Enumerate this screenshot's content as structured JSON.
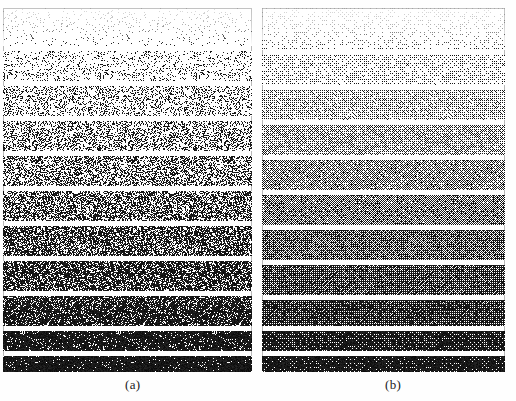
{
  "figure": {
    "type": "halftone-dither-comparison",
    "width": 516,
    "height": 401,
    "background_color": "#ffffff",
    "ink_color": "#000000",
    "border_color": "#b9b9b9",
    "faint_header_text": "",
    "panels": [
      {
        "id": "a",
        "caption": "(a)",
        "caption_x": 125,
        "caption_y": 377,
        "x": 3,
        "y": 8,
        "width": 249,
        "height": 364,
        "dither_method": "random-threshold-dither",
        "band_count": 11,
        "gap_px": 5,
        "bands": [
          {
            "index": 1,
            "gray_level": 0.04,
            "top": 0,
            "height": 38,
            "label": "5%"
          },
          {
            "index": 2,
            "gray_level": 0.14,
            "top": 43,
            "height": 30,
            "label": "15%"
          },
          {
            "index": 3,
            "gray_level": 0.26,
            "top": 78,
            "height": 30,
            "label": "25%"
          },
          {
            "index": 4,
            "gray_level": 0.36,
            "top": 113,
            "height": 30,
            "label": "35%"
          },
          {
            "index": 5,
            "gray_level": 0.46,
            "top": 148,
            "height": 30,
            "label": "45%"
          },
          {
            "index": 6,
            "gray_level": 0.55,
            "top": 183,
            "height": 30,
            "label": "55%"
          },
          {
            "index": 7,
            "gray_level": 0.64,
            "top": 218,
            "height": 30,
            "label": "65%"
          },
          {
            "index": 8,
            "gray_level": 0.73,
            "top": 253,
            "height": 30,
            "label": "75%"
          },
          {
            "index": 9,
            "gray_level": 0.82,
            "top": 288,
            "height": 30,
            "label": "85%"
          },
          {
            "index": 10,
            "gray_level": 0.9,
            "top": 323,
            "height": 20,
            "label": "92%"
          },
          {
            "index": 11,
            "gray_level": 0.96,
            "top": 348,
            "height": 16,
            "label": "97%"
          }
        ]
      },
      {
        "id": "b",
        "caption": "(b)",
        "caption_x": 385,
        "caption_y": 377,
        "x": 262,
        "y": 8,
        "width": 243,
        "height": 364,
        "dither_method": "ordered-bayer-dither",
        "band_count": 11,
        "gap_px": 5,
        "bands": [
          {
            "index": 1,
            "gray_level": 0.04,
            "top": 0,
            "height": 42,
            "label": "5%"
          },
          {
            "index": 2,
            "gray_level": 0.14,
            "top": 47,
            "height": 30,
            "label": "15%"
          },
          {
            "index": 3,
            "gray_level": 0.26,
            "top": 82,
            "height": 30,
            "label": "25%"
          },
          {
            "index": 4,
            "gray_level": 0.36,
            "top": 117,
            "height": 30,
            "label": "35%"
          },
          {
            "index": 5,
            "gray_level": 0.46,
            "top": 152,
            "height": 30,
            "label": "45%"
          },
          {
            "index": 6,
            "gray_level": 0.55,
            "top": 187,
            "height": 30,
            "label": "55%"
          },
          {
            "index": 7,
            "gray_level": 0.64,
            "top": 222,
            "height": 30,
            "label": "65%"
          },
          {
            "index": 8,
            "gray_level": 0.73,
            "top": 257,
            "height": 30,
            "label": "75%"
          },
          {
            "index": 9,
            "gray_level": 0.82,
            "top": 292,
            "height": 26,
            "label": "85%"
          },
          {
            "index": 10,
            "gray_level": 0.9,
            "top": 323,
            "height": 20,
            "label": "92%"
          },
          {
            "index": 11,
            "gray_level": 0.96,
            "top": 348,
            "height": 16,
            "label": "97%"
          }
        ]
      }
    ]
  },
  "chart_data": {
    "type": "heatmap",
    "title": "",
    "xlabel": "",
    "ylabel": "",
    "subplots": [
      "(a)",
      "(b)"
    ],
    "categories": [
      "band 1",
      "band 2",
      "band 3",
      "band 4",
      "band 5",
      "band 6",
      "band 7",
      "band 8",
      "band 9",
      "band 10",
      "band 11"
    ],
    "series": [
      {
        "name": "(a)",
        "values": [
          0.04,
          0.14,
          0.26,
          0.36,
          0.46,
          0.55,
          0.64,
          0.73,
          0.82,
          0.9,
          0.96
        ]
      },
      {
        "name": "(b)",
        "values": [
          0.04,
          0.14,
          0.26,
          0.36,
          0.46,
          0.55,
          0.64,
          0.73,
          0.82,
          0.9,
          0.96
        ]
      }
    ],
    "ylim": [
      0,
      1
    ],
    "grid": false,
    "legend": "none"
  }
}
